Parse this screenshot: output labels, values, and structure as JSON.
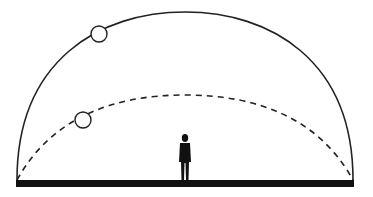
{
  "diagram": {
    "colors": {
      "background": "#ffffff",
      "stroke": "#222222",
      "ground": "#111111",
      "figure": "#111111"
    },
    "ground": {
      "x": 16,
      "y": 180,
      "width": 338,
      "height": 7
    },
    "arcs": [
      {
        "id": "summer-path",
        "style": "solid",
        "start": [
          17,
          180
        ],
        "end": [
          353,
          180
        ],
        "top_y": 12
      },
      {
        "id": "winter-path",
        "style": "dashed",
        "start": [
          17,
          180
        ],
        "end": [
          353,
          180
        ],
        "top_y": 95
      }
    ],
    "suns": [
      {
        "id": "sun-high",
        "cx": 99,
        "cy": 34,
        "r": 8
      },
      {
        "id": "sun-low",
        "cx": 83,
        "cy": 120,
        "r": 8
      }
    ],
    "person": {
      "x": 185,
      "base_y": 180,
      "height": 46
    }
  }
}
